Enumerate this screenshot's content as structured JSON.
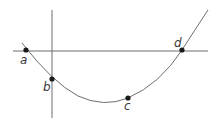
{
  "diagram": {
    "type": "parabola-with-axes",
    "colors": {
      "axis": "#6e6e6e",
      "curve": "#6e6e6e",
      "point": "#1a1a1a",
      "label": "#3a3a3a"
    },
    "axes": {
      "horizontal": {
        "x1": 13,
        "y1": 51,
        "x2": 208,
        "y2": 51
      },
      "vertical": {
        "x1": 52,
        "y1": 10,
        "x2": 52,
        "y2": 118
      }
    },
    "curve_path": "M 22 43 Q 52 82 78 96 Q 104 108 128 98 Q 160 84 182 50 Q 196 28 208 10",
    "points": [
      {
        "label": "a",
        "x": 26,
        "y": 50,
        "label_x": 20,
        "label_y": 64
      },
      {
        "label": "b",
        "x": 52,
        "y": 79,
        "label_x": 43,
        "label_y": 91
      },
      {
        "label": "c",
        "x": 128,
        "y": 98,
        "label_x": 124,
        "label_y": 110
      },
      {
        "label": "d",
        "x": 182,
        "y": 50,
        "label_x": 174,
        "label_y": 47
      }
    ]
  }
}
